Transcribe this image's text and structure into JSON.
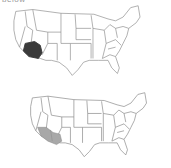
{
  "header": {
    "label_fragment": "below"
  },
  "maps": [
    {
      "name": "top",
      "region": "United States",
      "highlight": {
        "area": "southern California / southwest",
        "color": "#3a3a3a"
      }
    },
    {
      "name": "bottom",
      "region": "United States",
      "highlight": {
        "area": "southern California and western Arizona",
        "color": "#a8a8a8"
      }
    }
  ],
  "colors": {
    "state_border": "#8a8a8a",
    "state_fill": "#ffffff"
  }
}
